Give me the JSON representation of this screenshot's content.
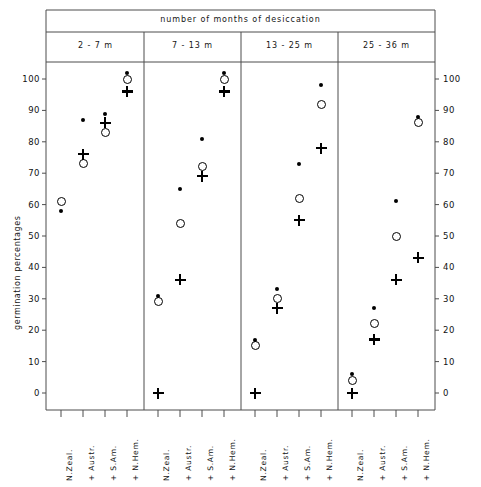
{
  "figure": {
    "header_title": "number of months of desiccation",
    "y_axis_title": "germination percentages",
    "y_ticks": [
      0,
      10,
      20,
      30,
      40,
      50,
      60,
      70,
      80,
      90,
      100
    ],
    "panels": [
      "2 - 7 m",
      "7 - 13 m",
      "13 - 25 m",
      "25 - 36 m"
    ],
    "x_categories": [
      "N.Zeal.",
      "+ Austr.",
      "+ S.Am.",
      "+ N.Hem."
    ],
    "marker_legend": [
      "dot",
      "open-circle",
      "plus"
    ],
    "colors": {
      "ink": "#000000",
      "frame": "#555555"
    }
  },
  "chart_data": {
    "type": "scatter",
    "title": "number of months of desiccation",
    "xlabel": "",
    "ylabel": "germination percentages",
    "ylim": [
      0,
      105
    ],
    "yticks": [
      0,
      10,
      20,
      30,
      40,
      50,
      60,
      70,
      80,
      90,
      100
    ],
    "grid": false,
    "legend_position": "none",
    "panel_variable": "number of months of desiccation",
    "panels": [
      "2 - 7 m",
      "7 - 13 m",
      "13 - 25 m",
      "25 - 36 m"
    ],
    "categories": [
      "N.Zeal.",
      "+ Austr.",
      "+ S.Am.",
      "+ N.Hem."
    ],
    "series": [
      {
        "name": "dot",
        "marker": "filled-circle"
      },
      {
        "name": "open-circle",
        "marker": "open-circle"
      },
      {
        "name": "plus",
        "marker": "plus"
      }
    ],
    "values": {
      "2 - 7 m": {
        "dot": [
          58,
          87,
          89,
          102
        ],
        "open-circle": [
          61,
          73,
          83,
          100
        ],
        "plus": [
          null,
          76,
          86,
          96
        ]
      },
      "7 - 13 m": {
        "dot": [
          31,
          65,
          81,
          102
        ],
        "open-circle": [
          29,
          54,
          72,
          100
        ],
        "plus": [
          0,
          36,
          69,
          96
        ]
      },
      "13 - 25 m": {
        "dot": [
          17,
          33,
          73,
          98
        ],
        "open-circle": [
          15,
          30,
          62,
          92
        ],
        "plus": [
          0,
          27,
          55,
          78
        ]
      },
      "25 - 36 m": {
        "dot": [
          6,
          27,
          61,
          88
        ],
        "open-circle": [
          4,
          22,
          50,
          86
        ],
        "plus": [
          0,
          17,
          36,
          43
        ]
      }
    }
  }
}
